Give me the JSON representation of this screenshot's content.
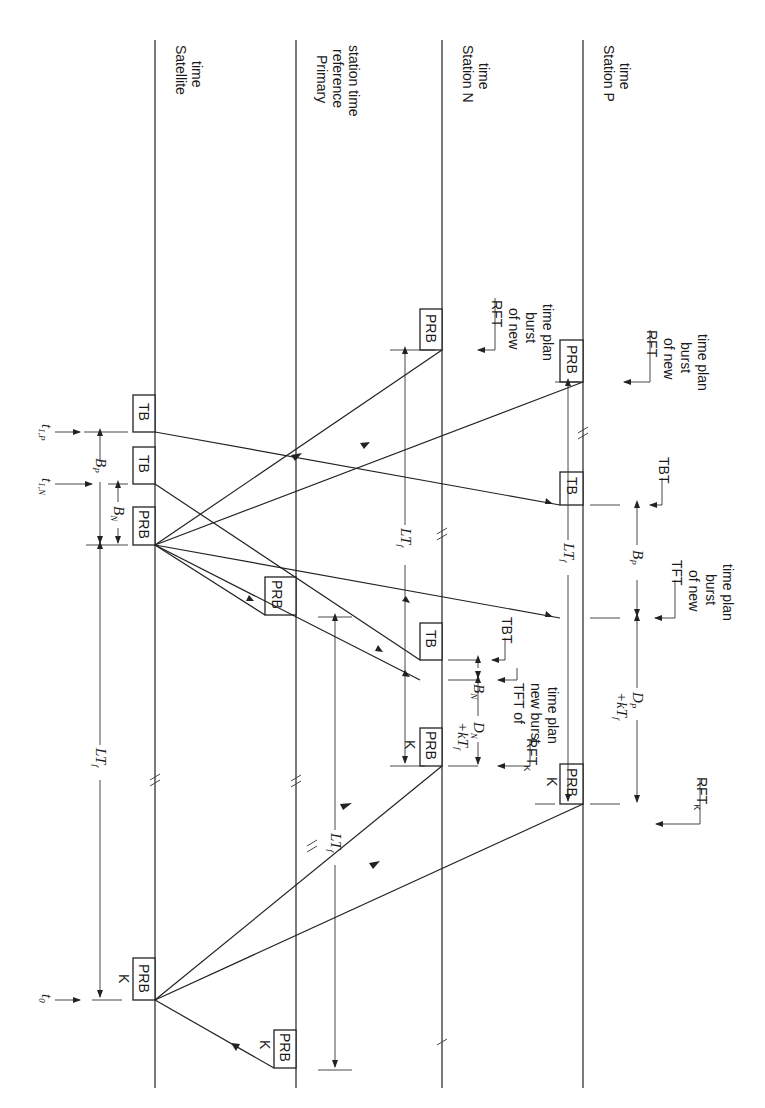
{
  "figure": {
    "orientation": "rotated 90deg clockwise",
    "timelines": [
      {
        "id": "satellite",
        "label_line1": "Satellite",
        "label_line2": "time"
      },
      {
        "id": "primary",
        "label_line1": "Primary",
        "label_line2": "reference",
        "label_line3": "station time"
      },
      {
        "id": "station_n",
        "label_line1": "Station N",
        "label_line2": "time"
      },
      {
        "id": "station_p",
        "label_line1": "Station P",
        "label_line2": "time"
      }
    ],
    "boxes": {
      "prb": "PRB",
      "tb": "TB",
      "k": "K"
    },
    "time_marks": {
      "t0": "t",
      "t0_sub": "0",
      "t1n": "t",
      "t1n_sub": "1,N",
      "t1p": "t",
      "t1p_sub": "1,P"
    },
    "durations": {
      "lt": "LT",
      "lt_sub": "f",
      "bn": "B",
      "bn_sub": "N",
      "bp": "B",
      "bp_sub": "P",
      "dn": "D",
      "dn_sub": "N",
      "dp": "D",
      "dp_sub": "P",
      "kt": "+kT",
      "kt_sub": "f"
    },
    "annotations": {
      "rft_new_n": [
        "RFT",
        "of new",
        "burst",
        "time plan"
      ],
      "rft_new_p": [
        "RFT",
        "of new",
        "burst",
        "time plan"
      ],
      "tbt_n": "TBT",
      "tbt_p": "TBT",
      "tft_n": [
        "TFT of",
        "new burst",
        "time plan"
      ],
      "tft_p": [
        "TFT",
        "of new",
        "burst",
        "time plan"
      ],
      "rftk": "RFT",
      "rftk_sub": "K"
    }
  }
}
